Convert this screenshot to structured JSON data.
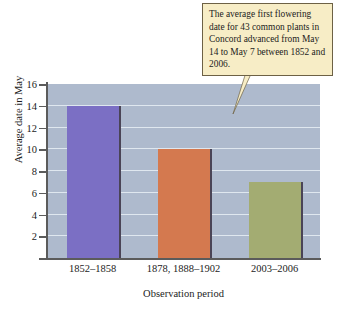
{
  "chart_data": {
    "type": "bar",
    "title": "",
    "categories": [
      "1852–1858",
      "1878, 1888–1902",
      "2003–2006"
    ],
    "values": [
      14,
      10,
      7
    ],
    "xlabel": "Observation period",
    "ylabel": "Average date in May",
    "ylim": [
      0,
      16
    ],
    "yticks": [
      2,
      4,
      6,
      8,
      10,
      12,
      14,
      16
    ],
    "ytick_labels": [
      "2",
      "4",
      "6",
      "8",
      "10",
      "12",
      "14",
      "16"
    ],
    "grid": true,
    "legend": false,
    "bar_colors": [
      "#7b6fc4",
      "#d4794f",
      "#a3ac72"
    ],
    "plot_background": "#aebacd",
    "gridline_color": "#e8eef5",
    "annotations": [
      {
        "name": "flowering-callout",
        "text": "The average first flowering date for 43 common plants in Concord advanced from May 14 to May 7 between 1852 and 2006.",
        "background": "#f7edc6",
        "border_color": "#6d6145"
      }
    ]
  }
}
